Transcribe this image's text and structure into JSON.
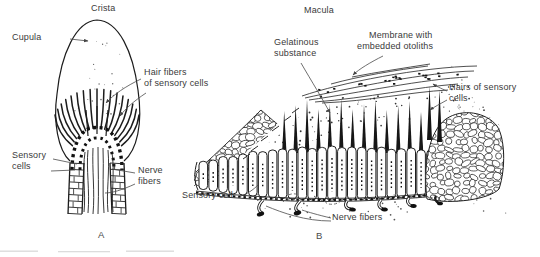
{
  "panel_a": {
    "title": "Crista",
    "letter": "A",
    "labels": {
      "cupula": "Cupula",
      "hair_fibers_line1": "Hair fibers",
      "hair_fibers_line2": "of sensory cells",
      "sensory_cells_line1": "Sensory",
      "sensory_cells_line2": "cells",
      "nerve_fibers_line1": "Nerve",
      "nerve_fibers_line2": "fibers"
    }
  },
  "panel_b": {
    "title": "Macula",
    "letter": "B",
    "labels": {
      "gelatinous_line1": "Gelatinous",
      "gelatinous_line2": "substance",
      "membrane_line1": "Membrane with",
      "membrane_line2": "embedded otoliths",
      "hairs_line1": "Hairs of sensory",
      "hairs_line2": "cells",
      "sensory_cell": "Sensory cell",
      "nerve_fibers": "Nerve fibers"
    }
  },
  "colors": {
    "ink": "#1f1f1f",
    "background": "#ffffff",
    "label_text": "#3a3a3a"
  }
}
